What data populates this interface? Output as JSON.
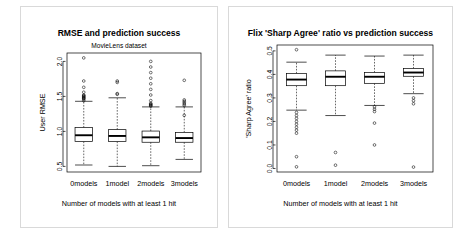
{
  "figure": {
    "background": "#ffffff",
    "frame_color": "#d9d9d9",
    "ink_color": "#000000",
    "panel_count": 2
  },
  "panels": [
    {
      "id": "rmse-panel",
      "title": "RMSE and prediction success",
      "subtitle": "MovieLens dataset",
      "chart_data": {
        "type": "boxplot",
        "title": "RMSE and prediction success",
        "subtitle": "MovieLens dataset",
        "xlabel": "Number of models with at least 1 hit",
        "ylabel": "User RMSE",
        "categories": [
          "0models",
          "1model",
          "2models",
          "3models"
        ],
        "ylim": [
          0.42,
          2.12
        ],
        "yticks": [
          0.5,
          1.0,
          1.5,
          2.0
        ],
        "yticklabels": [
          "0.5",
          "1.0",
          "1.5",
          "2.0"
        ],
        "grid": false,
        "legend": "none",
        "boxes": [
          {
            "category": "0models",
            "whisker_low": 0.52,
            "q1": 0.855,
            "median": 0.945,
            "q3": 1.055,
            "whisker_high": 1.43,
            "outliers": [
              1.44,
              1.46,
              1.47,
              1.48,
              1.49,
              1.5,
              1.51,
              1.52,
              1.56,
              1.63,
              1.72,
              2.05
            ]
          },
          {
            "category": "1model",
            "whisker_low": 0.5,
            "q1": 0.855,
            "median": 0.935,
            "q3": 1.025,
            "whisker_high": 1.48,
            "outliers": [
              1.53,
              1.54,
              1.7,
              1.72
            ]
          },
          {
            "category": "2models",
            "whisker_low": 0.51,
            "q1": 0.845,
            "median": 0.915,
            "q3": 1.005,
            "whisker_high": 1.35,
            "outliers": [
              1.36,
              1.37,
              1.38,
              1.39,
              1.4,
              1.44,
              1.52,
              1.6,
              1.68,
              1.76,
              1.84,
              1.92,
              2.0
            ]
          },
          {
            "category": "3models",
            "whisker_low": 0.6,
            "q1": 0.845,
            "median": 0.905,
            "q3": 0.985,
            "whisker_high": 1.35,
            "outliers": [
              1.23,
              1.37,
              1.39,
              1.41,
              1.43,
              1.45,
              1.73
            ]
          }
        ]
      }
    },
    {
      "id": "sharp-agree-panel",
      "title": "Flix 'Sharp Agree' ratio vs prediction success",
      "subtitle": "",
      "chart_data": {
        "type": "boxplot",
        "title": "Flix 'Sharp Agree' ratio vs prediction success",
        "xlabel": "Number of models with at least 1 hit",
        "ylabel": "'Sharp Agree' ratio",
        "categories": [
          "0models",
          "1model",
          "2models",
          "3models"
        ],
        "ylim": [
          -0.015,
          0.525
        ],
        "yticks": [
          0.0,
          0.1,
          0.2,
          0.3,
          0.4,
          0.5
        ],
        "yticklabels": [
          "0.0",
          "0.1",
          "0.2",
          "0.3",
          "0.4",
          "0.5"
        ],
        "grid": false,
        "legend": "none",
        "boxes": [
          {
            "category": "0models",
            "whisker_low": 0.248,
            "q1": 0.352,
            "median": 0.378,
            "q3": 0.404,
            "whisker_high": 0.452,
            "outliers": [
              0.505,
              0.238,
              0.225,
              0.213,
              0.2,
              0.188,
              0.175,
              0.163,
              0.15,
              0.05,
              0.007
            ]
          },
          {
            "category": "1model",
            "whisker_low": 0.225,
            "q1": 0.352,
            "median": 0.39,
            "q3": 0.415,
            "whisker_high": 0.482,
            "outliers": [
              0.068,
              0.014
            ]
          },
          {
            "category": "2models",
            "whisker_low": 0.268,
            "q1": 0.362,
            "median": 0.39,
            "q3": 0.408,
            "whisker_high": 0.478,
            "outliers": [
              0.262,
              0.252,
              0.242,
              0.193,
              0.1
            ]
          },
          {
            "category": "3models",
            "whisker_low": 0.318,
            "q1": 0.392,
            "median": 0.408,
            "q3": 0.425,
            "whisker_high": 0.482,
            "outliers": [
              0.3,
              0.288,
              0.275,
              0.006
            ]
          }
        ]
      }
    }
  ]
}
